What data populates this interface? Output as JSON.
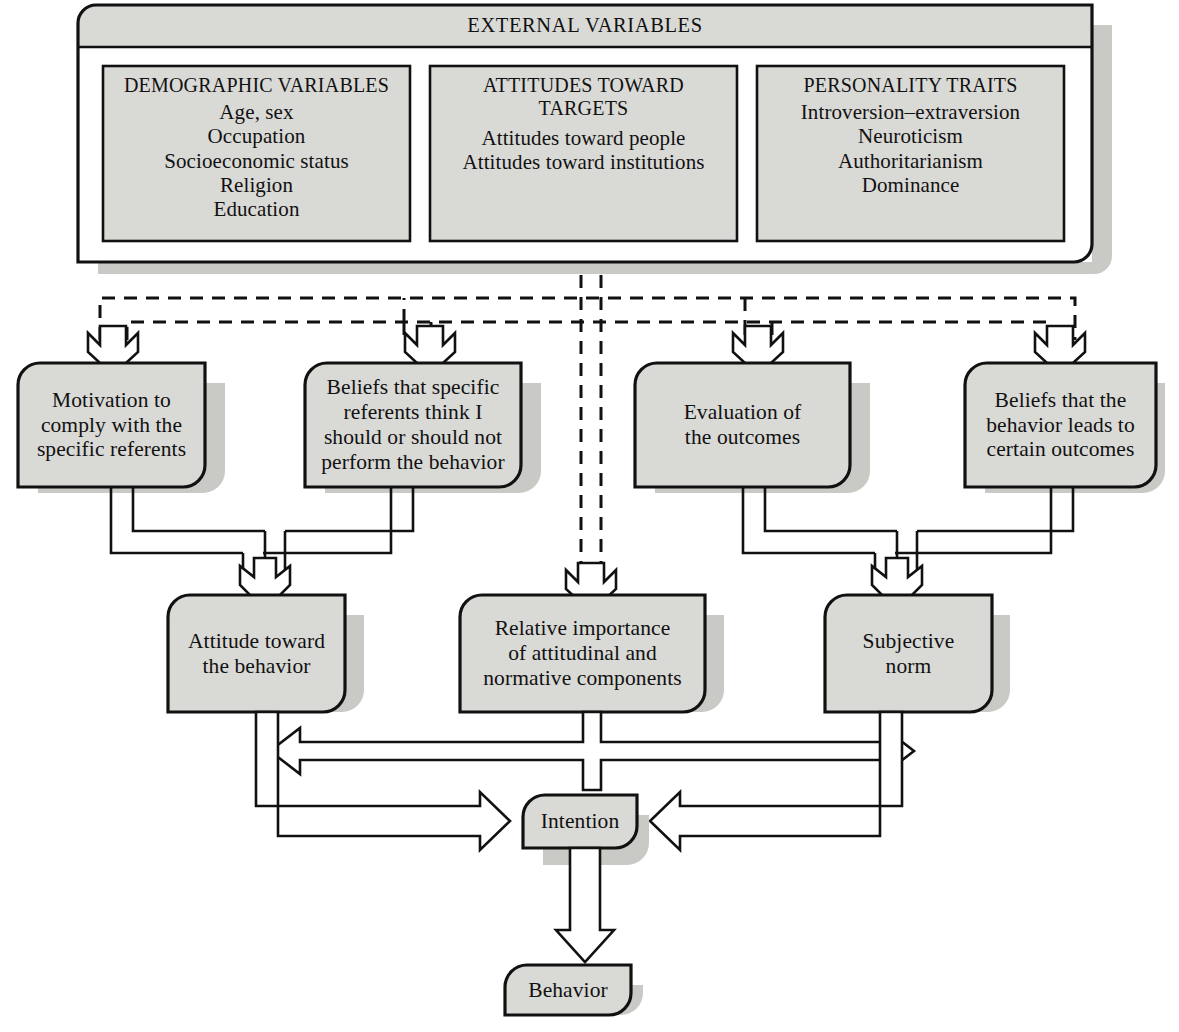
{
  "diagram": {
    "title": "EXTERNAL VARIABLES",
    "type": "flowchart",
    "style": {
      "box_fill": "#d9d9d6",
      "box_stroke": "#000000",
      "shadow": "#c9c9c6",
      "page_background": "#ffffff",
      "text_color": "#111111"
    },
    "external_variables": {
      "header": "EXTERNAL VARIABLES",
      "panels": [
        {
          "name": "demographic-variables",
          "heading": "DEMOGRAPHIC VARIABLES",
          "items_text": "Age, sex\nOccupation\nSocioeconomic status\nReligion\nEducation"
        },
        {
          "name": "attitudes-toward-targets",
          "heading": "ATTITUDES TOWARD\nTARGETS",
          "items_text": "Attitudes toward people\nAttitudes toward institutions"
        },
        {
          "name": "personality-traits",
          "heading": "PERSONALITY TRAITS",
          "items_text": "Introversion–extraversion\nNeuroticism\nAuthoritarianism\nDominance"
        }
      ]
    },
    "belief_nodes": [
      {
        "name": "motivation-to-comply",
        "label": "Motivation to\ncomply with the\nspecific referents"
      },
      {
        "name": "beliefs-specific-referents",
        "label": "Beliefs that specific\nreferents think I\nshould or should not\nperform the behavior"
      },
      {
        "name": "evaluation-of-outcomes",
        "label": "Evaluation of\nthe outcomes"
      },
      {
        "name": "beliefs-behavior-outcomes",
        "label": "Beliefs that the\nbehavior leads to\ncertain outcomes"
      }
    ],
    "component_nodes": [
      {
        "name": "attitude-toward-behavior",
        "label": "Attitude toward\nthe behavior"
      },
      {
        "name": "relative-importance",
        "label": "Relative importance\nof attitudinal and\nnormative components"
      },
      {
        "name": "subjective-norm",
        "label": "Subjective\nnorm"
      }
    ],
    "outcome_nodes": [
      {
        "name": "intention",
        "label": "Intention"
      },
      {
        "name": "behavior",
        "label": "Behavior"
      }
    ]
  }
}
